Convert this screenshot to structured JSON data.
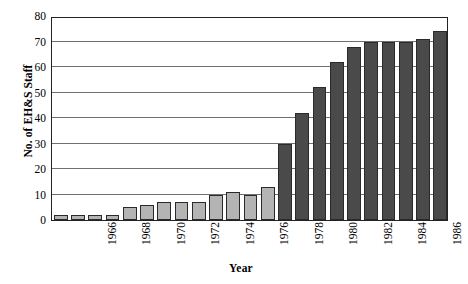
{
  "chart_data": {
    "type": "bar",
    "title": "",
    "xlabel": "Year",
    "ylabel": "No. of EH&S Staff",
    "ylim": [
      0,
      80
    ],
    "ytick_step": 10,
    "yticks": [
      80,
      70,
      60,
      50,
      40,
      30,
      20,
      10,
      0
    ],
    "grid": true,
    "legend": "none",
    "categories": [
      "1966",
      "1967",
      "1968",
      "1969",
      "1970",
      "1971",
      "1972",
      "1973",
      "1974",
      "1975",
      "1976",
      "1977",
      "1978",
      "1979",
      "1980",
      "1981",
      "1982",
      "1983",
      "1984",
      "1985",
      "1986",
      "1987",
      "1988"
    ],
    "xtick_labels_shown": [
      "1966",
      "1968",
      "1970",
      "1972",
      "1974",
      "1976",
      "1978",
      "1980",
      "1982",
      "1984",
      "1986"
    ],
    "values": [
      2,
      2,
      2,
      2,
      5,
      6,
      7,
      7,
      7,
      10,
      11,
      10,
      13,
      30,
      42,
      52,
      62,
      68,
      70,
      70,
      70,
      71,
      74
    ],
    "bar_colors": [
      "#b4b4b4",
      "#b4b4b4",
      "#b4b4b4",
      "#b4b4b4",
      "#b4b4b4",
      "#b4b4b4",
      "#b4b4b4",
      "#b4b4b4",
      "#b4b4b4",
      "#b4b4b4",
      "#b4b4b4",
      "#b4b4b4",
      "#b4b4b4",
      "#4a4a4a",
      "#4a4a4a",
      "#4a4a4a",
      "#4a4a4a",
      "#4a4a4a",
      "#4a4a4a",
      "#4a4a4a",
      "#4a4a4a",
      "#4a4a4a",
      "#4a4a4a"
    ],
    "colors": {
      "light_bar": "#b4b4b4",
      "dark_bar": "#4a4a4a",
      "bar_edge": "#2a2a2a",
      "gridline": "#6f6f6f",
      "frame": "#222222",
      "background": "#ffffff",
      "text": "#000000"
    }
  }
}
